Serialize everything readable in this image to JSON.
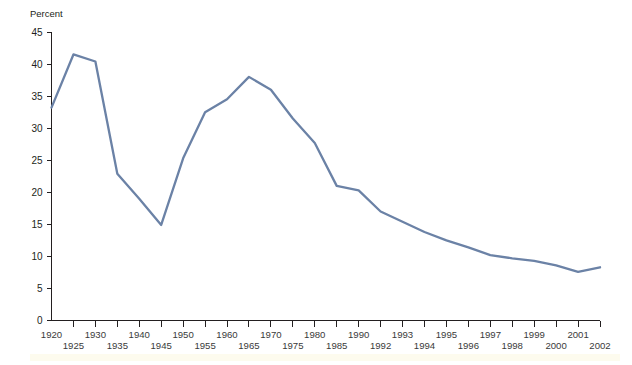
{
  "chart_data": {
    "type": "line",
    "title": "",
    "subtitle": "",
    "ylabel": "Percent",
    "xlabel": "",
    "ylim": [
      0,
      45
    ],
    "yticks": [
      0,
      5,
      10,
      15,
      20,
      25,
      30,
      35,
      40,
      45
    ],
    "grid": false,
    "legend": "none",
    "series_color": "#6b82a6",
    "categories": [
      "1920",
      "1925",
      "1930",
      "1935",
      "1940",
      "1945",
      "1950",
      "1955",
      "1960",
      "1965",
      "1970",
      "1975",
      "1980",
      "1985",
      "1990",
      "1992",
      "1993",
      "1994",
      "1995",
      "1996",
      "1997",
      "1998",
      "1999",
      "2000",
      "2001",
      "2002"
    ],
    "xtick_labels_upper": [
      "1920",
      "",
      "1930",
      "",
      "1940",
      "",
      "1950",
      "",
      "1960",
      "",
      "1970",
      "",
      "1980",
      "",
      "1990",
      "",
      "1993",
      "",
      "1995",
      "",
      "1997",
      "",
      "1999",
      "",
      "2001",
      ""
    ],
    "xtick_labels_lower": [
      "",
      "1925",
      "",
      "1935",
      "",
      "1945",
      "",
      "1955",
      "",
      "1965",
      "",
      "1975",
      "",
      "1985",
      "",
      "1992",
      "",
      "1994",
      "",
      "1996",
      "",
      "1998",
      "",
      "2000",
      "",
      "2002"
    ],
    "values": [
      33.2,
      41.5,
      40.4,
      22.9,
      19.0,
      14.9,
      25.3,
      32.5,
      34.5,
      38.0,
      36.0,
      31.5,
      27.7,
      21.0,
      20.3,
      17.0,
      15.4,
      13.8,
      12.5,
      11.4,
      10.2,
      9.7,
      9.3,
      8.6,
      7.6,
      8.3
    ],
    "point_count": 25,
    "value_labels": []
  },
  "footer": {
    "band_color": "#fdfbee"
  }
}
